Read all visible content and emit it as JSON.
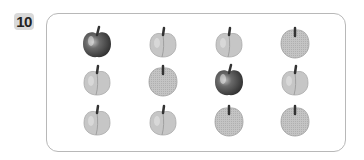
{
  "problem": {
    "number": "10"
  },
  "grid": {
    "columns_x": [
      97,
      163,
      229,
      295
    ],
    "rows_y": [
      42,
      80,
      120
    ],
    "items": [
      [
        "red-apple",
        "peach",
        "peach",
        "round-apple"
      ],
      [
        "peach",
        "round-apple",
        "red-apple",
        "peach"
      ],
      [
        "peach",
        "peach",
        "round-apple",
        "round-apple"
      ]
    ]
  },
  "colors": {
    "border": "#b8b8b8",
    "badge": "#d9d9d9",
    "red_apple": "#555555",
    "light_fruit": "#c8c8c8"
  }
}
